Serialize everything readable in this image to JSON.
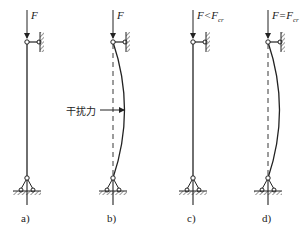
{
  "diagram": {
    "panels": [
      {
        "id": "a",
        "label": "a)",
        "force_label": "F",
        "force_sub": "",
        "state": "straight"
      },
      {
        "id": "b",
        "label": "b)",
        "force_label": "F",
        "force_sub": "",
        "state": "deflected-by-disturbance"
      },
      {
        "id": "c",
        "label": "c)",
        "force_label": "F<F",
        "force_sub": "cr",
        "state": "straight-returns"
      },
      {
        "id": "d",
        "label": "d)",
        "force_label": "F=F",
        "force_sub": "cr",
        "state": "stays-deflected"
      }
    ],
    "annotation": {
      "text": "干扰力",
      "meaning": "disturbance force",
      "points_to": "b"
    },
    "colors": {
      "line": "#222222",
      "background": "#ffffff"
    }
  }
}
